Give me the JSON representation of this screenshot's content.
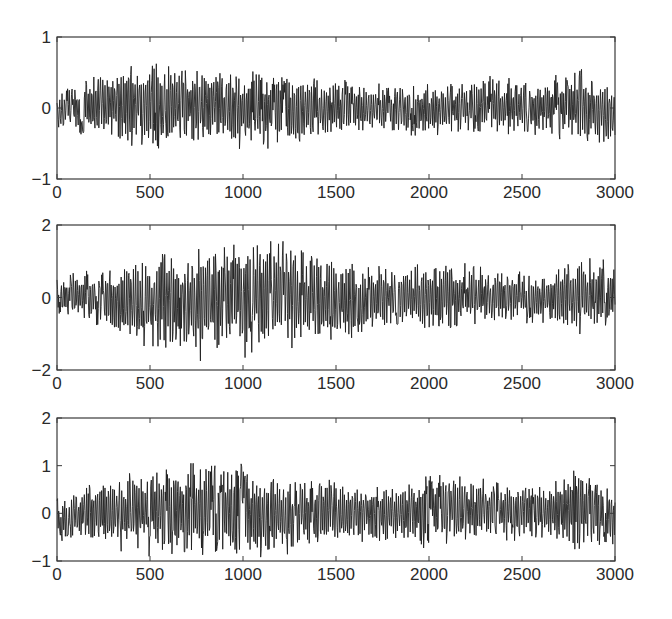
{
  "chart_data": [
    {
      "type": "line",
      "title": "",
      "xlabel": "",
      "ylabel": "",
      "xlim": [
        0,
        3000
      ],
      "ylim": [
        -1,
        1
      ],
      "xticks": [
        0,
        500,
        1000,
        1500,
        2000,
        2500,
        3000
      ],
      "xtick_labels": [
        "0",
        "500",
        "1000",
        "1500",
        "2000",
        "2500",
        "3000"
      ],
      "yticks": [
        -1,
        0,
        1
      ],
      "ytick_labels": [
        "-1",
        "0",
        "1"
      ],
      "grid": false,
      "series": [
        {
          "name": "signal",
          "color": "#1e1e1e",
          "n_points": 3000,
          "envelope": {
            "x": [
              0,
              250,
              400,
              700,
              1000,
              1200,
              1400,
              1700,
              2000,
              2300,
              2600,
              2800,
              3000
            ],
            "upper": [
              0.2,
              0.5,
              0.65,
              0.55,
              0.5,
              0.45,
              0.4,
              0.3,
              0.3,
              0.4,
              0.35,
              0.5,
              0.3
            ],
            "lower": [
              -0.3,
              -0.4,
              -0.55,
              -0.45,
              -0.55,
              -0.5,
              -0.4,
              -0.35,
              -0.35,
              -0.3,
              -0.35,
              -0.45,
              -0.45
            ]
          },
          "peak_max": 0.65,
          "peak_min": -0.6
        }
      ]
    },
    {
      "type": "line",
      "title": "",
      "xlabel": "",
      "ylabel": "",
      "xlim": [
        0,
        3000
      ],
      "ylim": [
        -2,
        2
      ],
      "xticks": [
        0,
        500,
        1000,
        1500,
        2000,
        2500,
        3000
      ],
      "xtick_labels": [
        "0",
        "500",
        "1000",
        "1500",
        "2000",
        "2500",
        "3000"
      ],
      "yticks": [
        -2,
        0,
        2
      ],
      "ytick_labels": [
        "-2",
        "0",
        "2"
      ],
      "grid": false,
      "series": [
        {
          "name": "signal",
          "color": "#1e1e1e",
          "n_points": 3000,
          "envelope": {
            "x": [
              0,
              250,
              500,
              750,
              1000,
              1200,
              1450,
              1700,
              2000,
              2300,
              2600,
              2800,
              3000
            ],
            "upper": [
              0.5,
              0.8,
              1.0,
              1.2,
              1.55,
              1.4,
              1.0,
              0.8,
              0.9,
              0.8,
              0.6,
              1.0,
              0.9
            ],
            "lower": [
              -0.4,
              -0.9,
              -1.4,
              -1.6,
              -1.5,
              -1.3,
              -1.2,
              -0.8,
              -0.9,
              -0.7,
              -0.6,
              -0.9,
              -0.6
            ]
          },
          "peak_max": 1.55,
          "peak_min": -1.75
        }
      ]
    },
    {
      "type": "line",
      "title": "",
      "xlabel": "",
      "ylabel": "",
      "xlim": [
        0,
        3000
      ],
      "ylim": [
        -1,
        2
      ],
      "xticks": [
        0,
        500,
        1000,
        1500,
        2000,
        2500,
        3000
      ],
      "xtick_labels": [
        "0",
        "500",
        "1000",
        "1500",
        "2000",
        "2500",
        "3000"
      ],
      "yticks": [
        -1,
        0,
        1,
        2
      ],
      "ytick_labels": [
        "-1",
        "0",
        "1",
        "2"
      ],
      "grid": false,
      "series": [
        {
          "name": "signal",
          "color": "#1e1e1e",
          "n_points": 3000,
          "envelope": {
            "x": [
              0,
              250,
              500,
              750,
              1000,
              1200,
              1450,
              1700,
              2000,
              2300,
              2600,
              2800,
              3000
            ],
            "upper": [
              0.3,
              0.7,
              0.85,
              1.0,
              0.9,
              0.7,
              0.65,
              0.55,
              0.75,
              0.65,
              0.6,
              0.85,
              0.5
            ],
            "lower": [
              -0.5,
              -0.65,
              -0.8,
              -0.8,
              -0.9,
              -0.85,
              -0.65,
              -0.55,
              -0.65,
              -0.5,
              -0.5,
              -0.7,
              -0.65
            ]
          },
          "peak_max": 1.05,
          "peak_min": -0.95
        }
      ]
    }
  ],
  "layout": {
    "panels": [
      {
        "left": 57,
        "right": 615,
        "top": 37,
        "bottom": 179
      },
      {
        "left": 57,
        "right": 615,
        "top": 225,
        "bottom": 370
      },
      {
        "left": 57,
        "right": 615,
        "top": 418,
        "bottom": 561
      }
    ]
  }
}
